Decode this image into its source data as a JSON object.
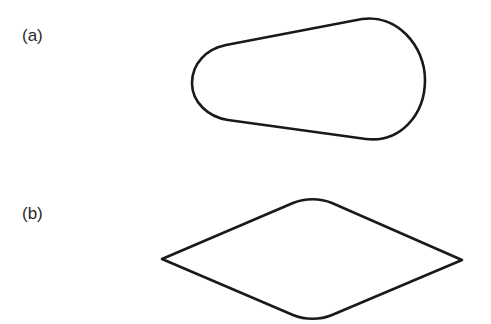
{
  "figure": {
    "panels": [
      {
        "label": "(a)",
        "shape": "rounded-tapered-oval"
      },
      {
        "label": "(b)",
        "shape": "rounded-rhombus"
      }
    ],
    "stroke_color": "#1a1a1a",
    "background_color": "#ffffff"
  }
}
